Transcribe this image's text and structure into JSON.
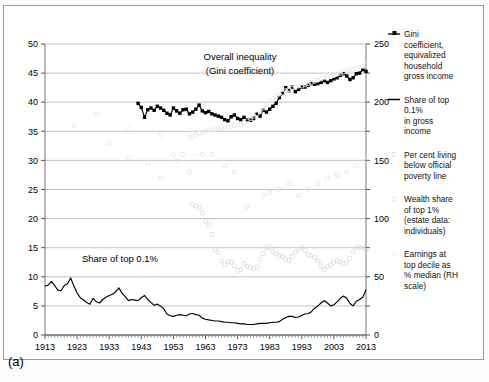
{
  "figure": {
    "panel_label": "(a)",
    "background": "#ffffff",
    "frame_color": "#9a9a9a"
  },
  "annotations": [
    {
      "name": "overall-inequality-line1",
      "text": "Overall inequality",
      "x": 240,
      "y": 60
    },
    {
      "name": "overall-inequality-line2",
      "text": "(Gini coefficient)",
      "x": 240,
      "y": 74
    },
    {
      "name": "share-top-01-label",
      "text": "Share of top 0.1%",
      "x": 120,
      "y": 262
    }
  ],
  "legend": {
    "position": "right",
    "items": [
      {
        "name": "gini-coefficient",
        "marker": "line-square-marker",
        "color": "#000000",
        "lines": [
          "Gini",
          "coefficient,",
          "equivalized",
          "household",
          "gross income"
        ]
      },
      {
        "name": "share-top-01-gross-income",
        "marker": "line-marker",
        "color": "#000000",
        "lines": [
          "Share of top",
          "0.1%",
          "in gross",
          "income"
        ]
      },
      {
        "name": "per-cent-living-below-poverty-line",
        "marker": "faint-circle-marker",
        "color": "#d8d8d8",
        "lines": [
          "Per cent living",
          "below official",
          "poverty line"
        ]
      },
      {
        "name": "wealth-share-top-1",
        "marker": "faint-circle-marker",
        "color": "#e2e2e2",
        "lines": [
          "Wealth share",
          "of top 1%",
          "(estate data:",
          "individuals)"
        ]
      },
      {
        "name": "earnings-top-decile",
        "marker": "faint-circle-marker",
        "color": "#e6e6e6",
        "lines": [
          "Earnings at",
          "top decile as",
          "% median (RH",
          "scale)"
        ]
      }
    ]
  },
  "chart_data": {
    "type": "line",
    "title": "",
    "xlabel": "",
    "ylabel": "",
    "grid": true,
    "xlim": [
      1913,
      2013
    ],
    "xticks": [
      1913,
      1923,
      1933,
      1943,
      1953,
      1963,
      1973,
      1983,
      1993,
      2003,
      2013
    ],
    "xtick_labels": [
      "1913",
      "1923",
      "1933",
      "1943",
      "1953",
      "1963",
      "1973",
      "1983",
      "1993",
      "2003",
      "2013"
    ],
    "left_axis": {
      "name": "left-y-axis",
      "ylim": [
        0,
        50
      ],
      "ticks": [
        0,
        5,
        10,
        15,
        20,
        25,
        30,
        35,
        40,
        45,
        50
      ],
      "tick_labels": [
        "0",
        "5",
        "10",
        "15",
        "20",
        "25",
        "30",
        "35",
        "40",
        "45",
        "50"
      ]
    },
    "right_axis": {
      "name": "right-y-axis",
      "ylim": [
        0,
        250
      ],
      "ticks": [
        0,
        50,
        100,
        150,
        200,
        250
      ],
      "tick_labels": [
        "0",
        "50",
        "100",
        "150",
        "200",
        "250"
      ],
      "minor_step": 25
    },
    "series": [
      {
        "name": "Gini coefficient, equivalized household gross income",
        "axis": "left",
        "style": "line-square-marker",
        "color": "#000000",
        "x": [
          1942,
          1943,
          1944,
          1945,
          1946,
          1947,
          1948,
          1949,
          1950,
          1951,
          1952,
          1953,
          1954,
          1955,
          1956,
          1957,
          1958,
          1959,
          1960,
          1961,
          1962,
          1963,
          1964,
          1965,
          1966,
          1967,
          1968,
          1969,
          1970,
          1971,
          1972,
          1973,
          1974,
          1975,
          1976,
          1977,
          1978,
          1979,
          1980,
          1981,
          1982,
          1983,
          1984,
          1985,
          1986,
          1987,
          1988,
          1989,
          1990,
          1991,
          1992,
          1993,
          1994,
          1995,
          1996,
          1997,
          1998,
          1999,
          2000,
          2001,
          2002,
          2003,
          2004,
          2005,
          2006,
          2007,
          2008,
          2009,
          2010,
          2011,
          2012,
          2013
        ],
        "y": [
          39.8,
          39.1,
          37.4,
          38.7,
          39.0,
          38.6,
          39.3,
          39.0,
          38.6,
          38.1,
          37.8,
          39.0,
          38.5,
          38.1,
          38.7,
          38.8,
          38.0,
          38.3,
          38.8,
          39.5,
          38.5,
          38.2,
          38.4,
          38.0,
          37.8,
          37.6,
          37.4,
          37.0,
          36.8,
          37.5,
          37.8,
          37.2,
          37.0,
          37.4,
          37.0,
          36.9,
          37.2,
          38.0,
          37.6,
          38.6,
          38.3,
          38.8,
          39.3,
          39.8,
          40.8,
          41.5,
          42.5,
          42.0,
          42.6,
          41.8,
          42.2,
          42.6,
          42.6,
          42.9,
          43.2,
          43.1,
          43.2,
          43.4,
          43.7,
          43.4,
          43.7,
          44.0,
          44.2,
          44.6,
          44.9,
          44.5,
          43.9,
          44.2,
          44.9,
          45.0,
          45.6,
          45.3
        ]
      },
      {
        "name": "Share of top 0.1% in gross income",
        "axis": "left",
        "style": "line",
        "color": "#000000",
        "x": [
          1913,
          1914,
          1915,
          1916,
          1917,
          1918,
          1919,
          1920,
          1921,
          1922,
          1923,
          1924,
          1925,
          1926,
          1927,
          1928,
          1929,
          1930,
          1931,
          1932,
          1933,
          1934,
          1935,
          1936,
          1937,
          1938,
          1939,
          1940,
          1941,
          1942,
          1943,
          1944,
          1945,
          1946,
          1947,
          1948,
          1949,
          1950,
          1951,
          1952,
          1953,
          1954,
          1955,
          1956,
          1957,
          1958,
          1959,
          1960,
          1961,
          1962,
          1963,
          1964,
          1965,
          1966,
          1967,
          1968,
          1969,
          1970,
          1971,
          1972,
          1973,
          1974,
          1975,
          1976,
          1977,
          1978,
          1979,
          1980,
          1981,
          1982,
          1983,
          1984,
          1985,
          1986,
          1987,
          1988,
          1989,
          1990,
          1991,
          1992,
          1993,
          1994,
          1995,
          1996,
          1997,
          1998,
          1999,
          2000,
          2001,
          2002,
          2003,
          2004,
          2005,
          2006,
          2007,
          2008,
          2009,
          2010,
          2011,
          2012,
          2013
        ],
        "y": [
          8.4,
          8.6,
          9.2,
          8.5,
          7.7,
          7.6,
          8.5,
          8.8,
          9.8,
          8.4,
          7.2,
          6.4,
          6.0,
          5.6,
          5.3,
          6.3,
          5.7,
          5.5,
          6.1,
          6.5,
          6.8,
          7.0,
          7.4,
          8.1,
          7.2,
          6.6,
          5.9,
          6.1,
          6.0,
          5.9,
          6.4,
          6.8,
          6.1,
          5.6,
          5.1,
          5.3,
          5.0,
          4.5,
          3.6,
          3.3,
          3.2,
          3.4,
          3.5,
          3.4,
          3.3,
          3.6,
          3.7,
          3.5,
          3.4,
          2.9,
          2.7,
          2.6,
          2.5,
          2.4,
          2.4,
          2.3,
          2.2,
          2.2,
          2.1,
          2.1,
          2.0,
          1.9,
          1.9,
          1.8,
          1.8,
          1.8,
          1.9,
          2.0,
          2.0,
          2.0,
          2.1,
          2.2,
          2.2,
          2.3,
          2.7,
          3.0,
          3.2,
          3.2,
          3.0,
          3.1,
          3.4,
          3.6,
          3.7,
          4.0,
          4.6,
          5.0,
          5.5,
          5.9,
          5.5,
          5.0,
          5.2,
          5.7,
          6.3,
          6.7,
          6.3,
          5.4,
          5.0,
          5.8,
          6.1,
          6.5,
          7.8
        ]
      },
      {
        "name": "Per cent living below official poverty line",
        "axis": "left",
        "style": "faint-circles",
        "color": "#dcdcdc",
        "x": [
          1959,
          1960,
          1961,
          1962,
          1963,
          1964,
          1965,
          1966,
          1967,
          1968,
          1969,
          1970,
          1971,
          1972,
          1973,
          1974,
          1975,
          1976,
          1977,
          1978,
          1979,
          1980,
          1981,
          1982,
          1983,
          1984,
          1985,
          1986,
          1987,
          1988,
          1989,
          1990,
          1991,
          1992,
          1993,
          1994,
          1995,
          1996,
          1997,
          1998,
          1999,
          2000,
          2001,
          2002,
          2003,
          2004,
          2005,
          2006,
          2007,
          2008,
          2009,
          2010,
          2011,
          2012,
          2013
        ],
        "y": [
          22.4,
          22.2,
          21.9,
          21.0,
          19.5,
          19.0,
          17.3,
          14.7,
          14.2,
          12.8,
          12.1,
          12.6,
          12.5,
          11.9,
          11.1,
          11.2,
          12.3,
          11.8,
          11.6,
          11.4,
          11.7,
          13.0,
          14.0,
          15.0,
          15.2,
          14.4,
          14.0,
          13.6,
          13.4,
          13.0,
          12.8,
          13.5,
          14.2,
          14.8,
          15.1,
          14.5,
          13.8,
          13.7,
          13.3,
          12.7,
          11.9,
          11.3,
          11.7,
          12.1,
          12.5,
          12.7,
          12.6,
          12.3,
          12.5,
          13.2,
          14.3,
          15.1,
          15.0,
          15.0,
          14.5
        ]
      },
      {
        "name": "Wealth share of top 1% (estate data: individuals)",
        "axis": "left",
        "style": "faint-circles",
        "color": "#e4e4e4",
        "x": [
          1922,
          1929,
          1933,
          1939,
          1945,
          1949,
          1953,
          1954,
          1956,
          1958,
          1962,
          1965,
          1969,
          1972,
          1976,
          1981,
          1983,
          1986,
          1989,
          1992,
          1995,
          1998,
          2001,
          2004,
          2007,
          2010,
          2013
        ],
        "y": [
          36.0,
          38.0,
          33.0,
          30.5,
          29.6,
          27.0,
          31.0,
          30.0,
          31.0,
          28.0,
          31.0,
          31.0,
          29.0,
          28.0,
          22.0,
          24.0,
          24.5,
          25.0,
          26.0,
          24.0,
          25.0,
          26.0,
          27.0,
          27.5,
          28.0,
          29.0,
          30.0
        ]
      },
      {
        "name": "Earnings at top decile as % median (RH scale)",
        "axis": "right",
        "style": "faint-circles",
        "color": "#e8e8e8",
        "x": [
          1939,
          1949,
          1958,
          1959,
          1960,
          1961,
          1962,
          1963,
          1964,
          1965,
          1966,
          1967,
          1968,
          1969,
          1970,
          1971,
          1972,
          1973,
          1974,
          1975,
          1976,
          1977,
          1978,
          1979,
          1980,
          1981,
          1982,
          1983,
          1984,
          1985,
          1986,
          1987,
          1988,
          1989,
          1990,
          1991,
          1992,
          1993,
          1994,
          1995,
          1996,
          1997,
          1998,
          1999,
          2000,
          2001,
          2002,
          2003,
          2004,
          2005,
          2006,
          2007,
          2008,
          2009,
          2010,
          2011,
          2012,
          2013
        ],
        "y": [
          177,
          172,
          170,
          171,
          172,
          173,
          174,
          175,
          176,
          176,
          177,
          177,
          178,
          178,
          179,
          179,
          180,
          180,
          181,
          182,
          184,
          186,
          188,
          190,
          192,
          195,
          198,
          201,
          203,
          205,
          207,
          208,
          210,
          211,
          212,
          213,
          214,
          214,
          215,
          216,
          217,
          218,
          219,
          220,
          221,
          221,
          222,
          223,
          224,
          225,
          226,
          227,
          228,
          228,
          229,
          230,
          231,
          232
        ]
      }
    ]
  }
}
